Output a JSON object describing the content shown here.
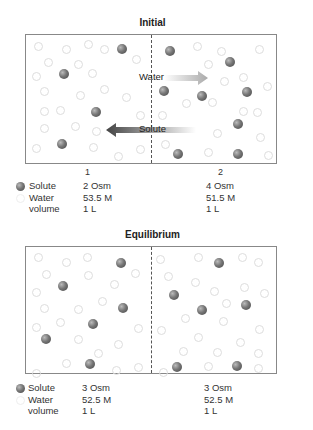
{
  "panels": [
    {
      "title": "Initial",
      "compartments": [
        "1",
        "2"
      ],
      "arrows": [
        {
          "label": "Water",
          "direction": "right"
        },
        {
          "label": "Solute",
          "direction": "left"
        }
      ],
      "legend": {
        "labels": [
          "Solute",
          "Water",
          "volume"
        ],
        "compartment_1": [
          "2 Osm",
          "53.5 M",
          "1 L"
        ],
        "compartment_2": [
          "4 Osm",
          "51.5 M",
          "1 L"
        ]
      }
    },
    {
      "title": "Equilibrium",
      "legend": {
        "labels": [
          "Solute",
          "Water",
          "volume"
        ],
        "compartment_1": [
          "3 Osm",
          "52.5 M",
          "1 L"
        ],
        "compartment_2": [
          "3 Osm",
          "52.5 M",
          "1 L"
        ]
      }
    }
  ],
  "colors": {
    "solute": "#666666",
    "water_outline": "#dddddd",
    "border": "#888888"
  }
}
